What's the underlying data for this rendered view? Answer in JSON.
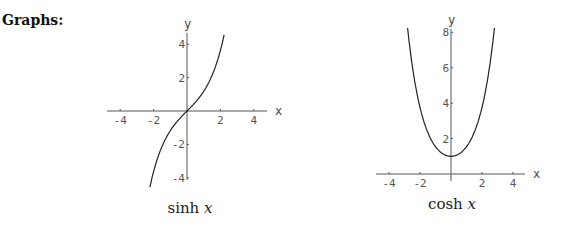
{
  "heading": "Graphs:",
  "chart_data": [
    {
      "type": "line",
      "title": "sinh x",
      "caption_fn": "sinh",
      "caption_var": "x",
      "xlabel": "x",
      "ylabel": "y",
      "xlim": [
        -4.8,
        4.8
      ],
      "ylim": [
        -4.6,
        4.6
      ],
      "x_ticks": [
        -4,
        -2,
        2,
        4
      ],
      "y_ticks": [
        4,
        2,
        -2,
        -4
      ],
      "function": "sinh",
      "x_range": [
        -2.3,
        2.3
      ],
      "grid": false,
      "points": [
        {
          "x": -2.2,
          "y": -4.46
        },
        {
          "x": -2,
          "y": -3.63
        },
        {
          "x": -1.5,
          "y": -2.13
        },
        {
          "x": -1,
          "y": -1.18
        },
        {
          "x": -0.5,
          "y": -0.52
        },
        {
          "x": 0,
          "y": 0
        },
        {
          "x": 0.5,
          "y": 0.52
        },
        {
          "x": 1,
          "y": 1.18
        },
        {
          "x": 1.5,
          "y": 2.13
        },
        {
          "x": 2,
          "y": 3.63
        },
        {
          "x": 2.2,
          "y": 4.46
        }
      ],
      "layout": {
        "origin_px": [
          187,
          111
        ],
        "sx": 16.7,
        "sy": 16.7,
        "x_axis_px": [
          107,
          267
        ],
        "y_axis_px": [
          33,
          180
        ],
        "caption_px": [
          190,
          213
        ]
      }
    },
    {
      "type": "line",
      "title": "cosh x",
      "caption_fn": "cosh",
      "caption_var": "x",
      "xlabel": "x",
      "ylabel": "y",
      "xlim": [
        -4.8,
        4.8
      ],
      "ylim": [
        0,
        8.3
      ],
      "x_ticks": [
        -4,
        -2,
        2,
        4
      ],
      "y_ticks": [
        8,
        6,
        4,
        2
      ],
      "function": "cosh",
      "x_range": [
        -2.8,
        2.8
      ],
      "grid": false,
      "points": [
        {
          "x": -2.8,
          "y": 8.25
        },
        {
          "x": -2,
          "y": 3.76
        },
        {
          "x": -1.5,
          "y": 2.35
        },
        {
          "x": -1,
          "y": 1.54
        },
        {
          "x": -0.5,
          "y": 1.13
        },
        {
          "x": 0,
          "y": 1
        },
        {
          "x": 0.5,
          "y": 1.13
        },
        {
          "x": 1,
          "y": 1.54
        },
        {
          "x": 1.5,
          "y": 2.35
        },
        {
          "x": 2,
          "y": 3.76
        },
        {
          "x": 2.8,
          "y": 8.25
        }
      ],
      "layout": {
        "origin_px": [
          451,
          174
        ],
        "sx": 15.5,
        "sy": 17.7,
        "x_axis_px": [
          376,
          525
        ],
        "y_axis_px": [
          29,
          181
        ],
        "caption_px": [
          452,
          209
        ]
      }
    }
  ]
}
